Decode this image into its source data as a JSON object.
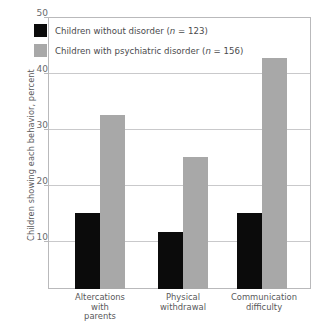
{
  "chart_data": {
    "type": "bar",
    "title": "",
    "xlabel": "",
    "ylabel": "Children showing each behavior, percent",
    "ylim": [
      0,
      50
    ],
    "yticks": [
      10,
      20,
      30,
      40,
      50
    ],
    "grid": true,
    "legend_position": "top-left",
    "categories": [
      "Altercations with parents",
      "Physical withdrawal",
      "Communication difficulty"
    ],
    "category_lines": [
      [
        "Altercations",
        "with",
        "parents"
      ],
      [
        "Physical",
        "withdrawal"
      ],
      [
        "Communication",
        "difficulty"
      ]
    ],
    "series": [
      {
        "name": "Children without disorder (n = 123)",
        "color": "#0b0b0b",
        "values": [
          14,
          10.5,
          14
        ]
      },
      {
        "name": "Children with psychiatric disorder (n = 156)",
        "color": "#a8a8a8",
        "values": [
          32,
          24.3,
          42.5
        ]
      }
    ]
  },
  "legend": {
    "items": [
      {
        "swatch": "black",
        "label_main": "Children without disorder (",
        "label_n": "n",
        "label_tail": " = 123)"
      },
      {
        "swatch": "gray",
        "label_main": "Children with psychiatric disorder (",
        "label_n": "n",
        "label_tail": " = 156)"
      }
    ]
  },
  "axis": {
    "y_title": "Children showing each behavior, percent",
    "y_tick_50": "50",
    "y_tick_40": "40",
    "y_tick_30": "30",
    "y_tick_20": "20",
    "y_tick_10": "10"
  }
}
